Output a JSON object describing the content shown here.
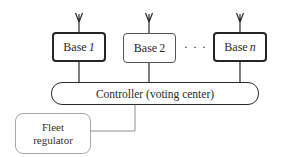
{
  "diagram": {
    "bases": [
      {
        "label": "Base",
        "index": "1"
      },
      {
        "label": "Base",
        "index": "2"
      },
      {
        "label": "Base",
        "index": "n"
      }
    ],
    "ellipsis": "· · ·",
    "controller": {
      "label": "Controller (voting center)"
    },
    "fleet_regulator": {
      "line1": "Fleet",
      "line2": "regulator"
    },
    "icons": {
      "antenna": "antenna-icon"
    },
    "colors": {
      "stroke_dark": "#262626",
      "stroke_mid": "#555555",
      "stroke_light": "#a8a8a8",
      "connector_gray": "#8c8c8c",
      "background": "#ffffff"
    }
  }
}
